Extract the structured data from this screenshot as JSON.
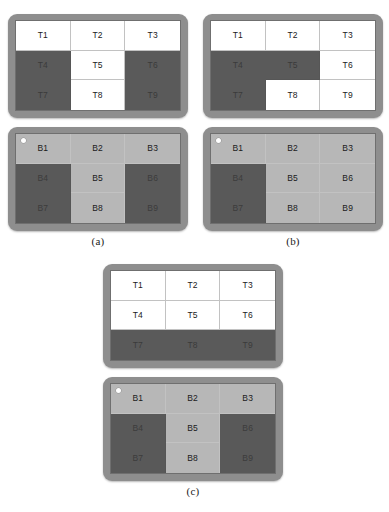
{
  "figure": {
    "canvas": {
      "width": 389,
      "height": 512
    },
    "colors": {
      "bezel": "#8e8e8e",
      "screen_border": "#6f6f6f",
      "tile_white": "#ffffff",
      "tile_dark": "#5a5a5a",
      "block_light": "#b7b7b7",
      "block_dark": "#595959",
      "grid_line": "#c2c2c2",
      "edge_strip": "#c9c9c9",
      "camera_dot": "#ffffff",
      "text": "#1b1b1b"
    },
    "legend": {
      "white_meaning": "uncovered / free tile",
      "dark_meaning": "covered / occupied region"
    },
    "subfigures": [
      {
        "id": "a",
        "caption": "(a)",
        "position": "row-left",
        "panels": [
          {
            "id": "a-top",
            "kind": "tiles",
            "prefix": "T",
            "has_camera_dot": false,
            "has_edge_strip": true,
            "cells": [
              {
                "label": "T1",
                "state": "white"
              },
              {
                "label": "T2",
                "state": "white"
              },
              {
                "label": "T3",
                "state": "white"
              },
              {
                "label": "T4",
                "state": "dark"
              },
              {
                "label": "T5",
                "state": "white"
              },
              {
                "label": "T6",
                "state": "dark"
              },
              {
                "label": "T7",
                "state": "dark"
              },
              {
                "label": "T8",
                "state": "white"
              },
              {
                "label": "T9",
                "state": "dark"
              }
            ]
          },
          {
            "id": "a-bottom",
            "kind": "blocks",
            "prefix": "B",
            "has_camera_dot": true,
            "has_edge_strip": false,
            "cells": [
              {
                "label": "B1",
                "state": "light"
              },
              {
                "label": "B2",
                "state": "light"
              },
              {
                "label": "B3",
                "state": "light"
              },
              {
                "label": "B4",
                "state": "dark"
              },
              {
                "label": "B5",
                "state": "light"
              },
              {
                "label": "B6",
                "state": "dark"
              },
              {
                "label": "B7",
                "state": "dark"
              },
              {
                "label": "B8",
                "state": "light"
              },
              {
                "label": "B9",
                "state": "dark"
              }
            ]
          }
        ]
      },
      {
        "id": "b",
        "caption": "(b)",
        "position": "row-right",
        "panels": [
          {
            "id": "b-top",
            "kind": "tiles",
            "prefix": "T",
            "has_camera_dot": false,
            "has_edge_strip": true,
            "cells": [
              {
                "label": "T1",
                "state": "white"
              },
              {
                "label": "T2",
                "state": "white"
              },
              {
                "label": "T3",
                "state": "white"
              },
              {
                "label": "T4",
                "state": "dark"
              },
              {
                "label": "T5",
                "state": "dark"
              },
              {
                "label": "T6",
                "state": "white"
              },
              {
                "label": "T7",
                "state": "dark"
              },
              {
                "label": "T8",
                "state": "white"
              },
              {
                "label": "T9",
                "state": "white"
              }
            ]
          },
          {
            "id": "b-bottom",
            "kind": "blocks",
            "prefix": "B",
            "has_camera_dot": true,
            "has_edge_strip": false,
            "cells": [
              {
                "label": "B1",
                "state": "light"
              },
              {
                "label": "B2",
                "state": "light"
              },
              {
                "label": "B3",
                "state": "light"
              },
              {
                "label": "B4",
                "state": "dark"
              },
              {
                "label": "B5",
                "state": "light"
              },
              {
                "label": "B6",
                "state": "light"
              },
              {
                "label": "B7",
                "state": "dark"
              },
              {
                "label": "B8",
                "state": "light"
              },
              {
                "label": "B9",
                "state": "light"
              }
            ]
          }
        ]
      },
      {
        "id": "c",
        "caption": "(c)",
        "position": "row-center",
        "panels": [
          {
            "id": "c-top",
            "kind": "tiles",
            "prefix": "T",
            "has_camera_dot": false,
            "has_edge_strip": true,
            "cells": [
              {
                "label": "T1",
                "state": "white"
              },
              {
                "label": "T2",
                "state": "white"
              },
              {
                "label": "T3",
                "state": "white"
              },
              {
                "label": "T4",
                "state": "white"
              },
              {
                "label": "T5",
                "state": "white"
              },
              {
                "label": "T6",
                "state": "white"
              },
              {
                "label": "T7",
                "state": "dark"
              },
              {
                "label": "T8",
                "state": "dark"
              },
              {
                "label": "T9",
                "state": "dark"
              }
            ]
          },
          {
            "id": "c-bottom",
            "kind": "blocks",
            "prefix": "B",
            "has_camera_dot": true,
            "has_edge_strip": false,
            "cells": [
              {
                "label": "B1",
                "state": "light"
              },
              {
                "label": "B2",
                "state": "light"
              },
              {
                "label": "B3",
                "state": "light"
              },
              {
                "label": "B4",
                "state": "dark"
              },
              {
                "label": "B5",
                "state": "light"
              },
              {
                "label": "B6",
                "state": "dark"
              },
              {
                "label": "B7",
                "state": "dark"
              },
              {
                "label": "B8",
                "state": "light"
              },
              {
                "label": "B9",
                "state": "dark"
              }
            ]
          }
        ]
      }
    ]
  }
}
